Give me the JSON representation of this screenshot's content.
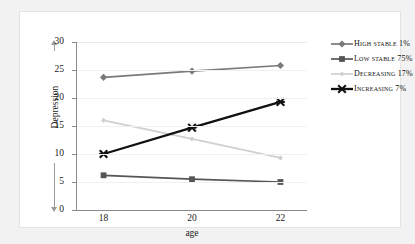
{
  "chart_data": {
    "type": "line",
    "title": "",
    "xlabel": "age",
    "ylabel": "Depression",
    "x": [
      18,
      20,
      22
    ],
    "xticklabels": [
      "18",
      "20",
      "22"
    ],
    "xlim": [
      17.4,
      22.6
    ],
    "ylim": [
      0,
      30
    ],
    "yticks": [
      0,
      5,
      10,
      15,
      20,
      25,
      30
    ],
    "yticklabels": [
      "0",
      "5",
      "10",
      "15",
      "20",
      "25",
      "30"
    ],
    "grid": "horizontal",
    "legend_position": "right",
    "series": [
      {
        "name": "High stable 1%",
        "values": [
          23.7,
          24.8,
          25.8
        ],
        "color": "#7a7a7a",
        "marker": "diamond"
      },
      {
        "name": "Low stable 75%",
        "values": [
          6.2,
          5.5,
          5.0
        ],
        "color": "#555555",
        "marker": "square"
      },
      {
        "name": "Decreasing 17%",
        "values": [
          16.0,
          12.7,
          9.3
        ],
        "color": "#d0d0d0",
        "marker": "star"
      },
      {
        "name": "Increasing 7%",
        "values": [
          10.0,
          14.7,
          19.3
        ],
        "color": "#111111",
        "marker": "x"
      }
    ]
  },
  "legend": {
    "items": [
      {
        "label": "High stable 1%"
      },
      {
        "label": "Low stable 75%"
      },
      {
        "label": "Decreasing 17%"
      },
      {
        "label": "Increasing 7%"
      }
    ]
  }
}
